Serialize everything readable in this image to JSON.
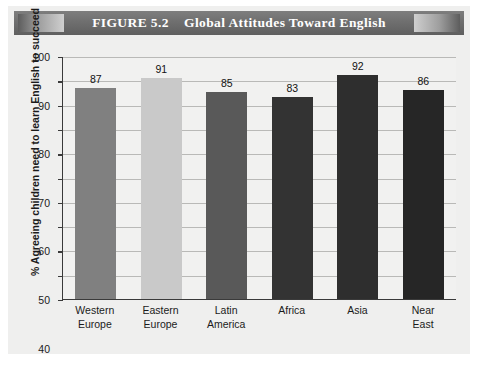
{
  "figure": {
    "label": "FIGURE 5.2",
    "title": "Global Attitudes Toward English",
    "banner_text": "FIGURE 5.2    Global Attitudes Toward English"
  },
  "colors": {
    "banner": "#6f6f6f",
    "plot_background": "#f1f1f0",
    "panel_background": "#efefee",
    "axis": "#3a3a3a",
    "gridline": "#b9b9b7",
    "bar_western_europe": "#808080",
    "bar_eastern_europe": "#c9c9c9",
    "bar_latin_america": "#595959",
    "bar_africa": "#333333",
    "bar_asia": "#2e2e2e",
    "bar_near_east": "#262626"
  },
  "chart_data": {
    "type": "bar",
    "title": "Global Attitudes Toward English",
    "xlabel": "",
    "ylabel": "% Agreeing children need to learn English to succeed",
    "ylim": [
      0,
      100
    ],
    "ytick_step": 10,
    "yticks": [
      0,
      10,
      20,
      30,
      40,
      50,
      60,
      70,
      80,
      90,
      100
    ],
    "ytick_labels": [
      "0",
      "10",
      "20",
      "30",
      "40",
      "50",
      "60",
      "70",
      "80",
      "90",
      "100"
    ],
    "grid": true,
    "legend": false,
    "categories": [
      "Western\nEurope",
      "Eastern\nEurope",
      "Latin\nAmerica",
      "Africa",
      "Asia",
      "Near\nEast"
    ],
    "category_lines": [
      [
        "Western",
        "Europe"
      ],
      [
        "Eastern",
        "Europe"
      ],
      [
        "Latin",
        "America"
      ],
      [
        "Africa",
        ""
      ],
      [
        "Asia",
        ""
      ],
      [
        "Near",
        "East"
      ]
    ],
    "values": [
      87,
      91,
      85,
      83,
      92,
      86
    ],
    "value_labels": [
      "87",
      "91",
      "85",
      "83",
      "92",
      "86"
    ],
    "bar_colors": [
      "#808080",
      "#c9c9c9",
      "#595959",
      "#333333",
      "#2e2e2e",
      "#262626"
    ]
  }
}
